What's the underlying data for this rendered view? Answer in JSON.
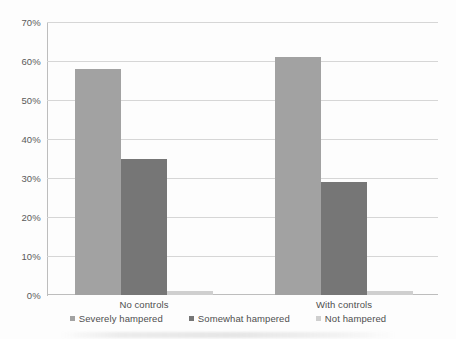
{
  "chart_data": {
    "type": "bar",
    "title": "",
    "subtitle": "",
    "xlabel": "",
    "ylabel": "",
    "categories": [
      "No controls",
      "With controls"
    ],
    "series": [
      {
        "name": "Severely hampered",
        "color": "#a2a2a2",
        "values": [
          58,
          61
        ]
      },
      {
        "name": "Somewhat hampered",
        "color": "#767676",
        "values": [
          35,
          29
        ]
      },
      {
        "name": "Not hampered",
        "color": "#cfcfcf",
        "values": [
          1,
          1
        ]
      }
    ],
    "ylim": [
      0,
      70
    ],
    "ytick_values": [
      0,
      10,
      20,
      30,
      40,
      50,
      60,
      70
    ],
    "ytick_labels": [
      "0%",
      "10%",
      "20%",
      "30%",
      "40%",
      "50%",
      "60%",
      "70%"
    ],
    "grid": true,
    "grid_axis": "y",
    "legend_position": "bottom",
    "value_suffix": "%"
  },
  "axis": {
    "y_labels": [
      "70%",
      "60%",
      "50%",
      "40%",
      "30%",
      "20%",
      "10%",
      "0%"
    ]
  },
  "legend": {
    "items": [
      {
        "label": "Severely hampered",
        "color": "#a2a2a2"
      },
      {
        "label": "Somewhat hampered",
        "color": "#767676"
      },
      {
        "label": "Not hampered",
        "color": "#cfcfcf"
      }
    ]
  },
  "colors": {
    "severely_hampered": "#a2a2a2",
    "somewhat_hampered": "#767676",
    "not_hampered": "#cfcfcf",
    "gridline": "#d6d6d6",
    "axis": "#bdbdbd",
    "text": "#4f4f4f",
    "background": "#ffffff"
  }
}
